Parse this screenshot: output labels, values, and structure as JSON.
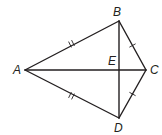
{
  "diagram": {
    "type": "kite",
    "points": {
      "A": {
        "label": "A",
        "x": 25,
        "y": 70
      },
      "B": {
        "label": "B",
        "x": 119,
        "y": 21
      },
      "C": {
        "label": "C",
        "x": 146,
        "y": 70
      },
      "D": {
        "label": "D",
        "x": 119,
        "y": 118
      },
      "E": {
        "label": "E",
        "x": 119,
        "y": 70
      }
    },
    "segments": [
      "AB",
      "BC",
      "CD",
      "DA",
      "AC",
      "BD"
    ],
    "congruence_marks": {
      "double": [
        "AB",
        "AD"
      ],
      "single": [
        "BC",
        "CD"
      ]
    },
    "stroke_color": "#231f20"
  }
}
